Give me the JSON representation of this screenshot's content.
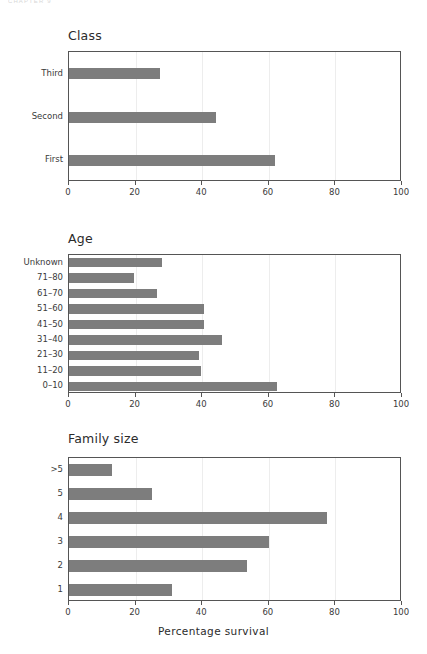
{
  "running_header": "CHAPTER 9",
  "axis_title": "Percentage survival",
  "colors": {
    "bar": "#7d7d7d",
    "frame": "#555555",
    "grid": "#ededed",
    "text": "#3a3a3a",
    "title": "#2b2b2b"
  },
  "chart_data": [
    {
      "type": "bar",
      "orientation": "horizontal",
      "title": "Class",
      "xlabel": "",
      "ylabel": "",
      "xlim": [
        0,
        100
      ],
      "xticks": [
        0,
        20,
        40,
        60,
        80,
        100
      ],
      "grid": true,
      "legend": "none",
      "categories": [
        "First",
        "Second",
        "Third"
      ],
      "values": [
        62,
        44,
        27.4
      ]
    },
    {
      "type": "bar",
      "orientation": "horizontal",
      "title": "Age",
      "xlabel": "",
      "ylabel": "",
      "xlim": [
        0,
        100
      ],
      "xticks": [
        0,
        20,
        40,
        60,
        80,
        100
      ],
      "grid": true,
      "legend": "none",
      "categories": [
        "0–10",
        "11–20",
        "21–30",
        "31–40",
        "41–50",
        "51–60",
        "61–70",
        "71–80",
        "Unknown"
      ],
      "values": [
        62.5,
        39.5,
        39,
        46,
        40.5,
        40.5,
        26.5,
        19.5,
        28
      ]
    },
    {
      "type": "bar",
      "orientation": "horizontal",
      "title": "Family size",
      "xlabel": "Percentage survival",
      "ylabel": "",
      "xlim": [
        0,
        100
      ],
      "xticks": [
        0,
        20,
        40,
        60,
        80,
        100
      ],
      "grid": true,
      "legend": "none",
      "categories": [
        "1",
        "2",
        "3",
        "4",
        "5",
        ">5"
      ],
      "values": [
        31,
        53.5,
        60,
        77.5,
        25,
        13
      ]
    }
  ]
}
